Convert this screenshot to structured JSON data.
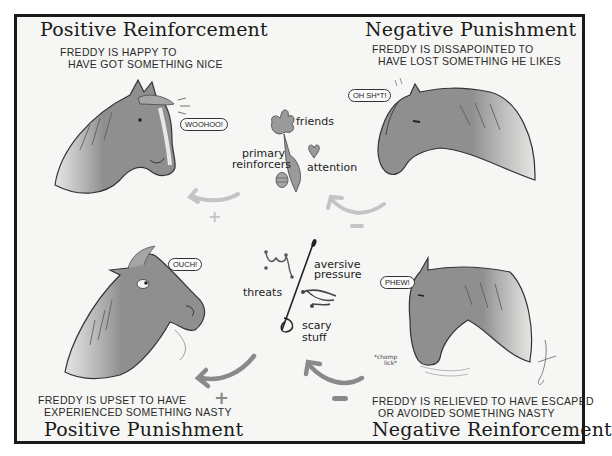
{
  "quadrants": {
    "positive_reinforcement": {
      "title": "Positive Reinforcement",
      "caption_line1": "FREDDY IS HAPPY TO",
      "caption_line2": "HAVE GOT SOMETHING NICE",
      "bubble": "WOOHOO!",
      "sign": "+"
    },
    "negative_punishment": {
      "title": "Negative Punishment",
      "caption_line1": "FREDDY IS DISSAPOINTED TO",
      "caption_line2": "HAVE LOST SOMETHING HE LIKES",
      "bubble": "OH SH*T!",
      "sign": "–"
    },
    "positive_punishment": {
      "title": "Positive Punishment",
      "caption_line1": "FREDDY IS UPSET TO HAVE",
      "caption_line2": "EXPERIENCED SOMETHING NASTY",
      "bubble": "OUCH!",
      "sign": "+"
    },
    "negative_reinforcement": {
      "title": "Negative Reinforcement",
      "caption_line1": "FREDDY IS RELIEVED TO HAVE ESCAPED",
      "caption_line2": "OR AVOIDED SOMETHING NASTY",
      "bubble": "PHEW!",
      "sign": "–",
      "note_line1": "*chomp",
      "note_line2": "lick*"
    }
  },
  "center_top": {
    "labels": {
      "friends": "friends",
      "primary_line1": "primary",
      "primary_line2": "reinforcers",
      "attention": "attention"
    },
    "icons": [
      "hand-icon",
      "carrot-icon",
      "heart-icon",
      "treat-icon"
    ]
  },
  "center_bottom": {
    "labels": {
      "threats": "threats",
      "aversive_line1": "aversive",
      "aversive_line2": "pressure",
      "scary_line1": "scary",
      "scary_line2": "stuff"
    },
    "icons": [
      "bit-icon",
      "whip-icon",
      "spur-icon"
    ]
  },
  "colors": {
    "horse": "#8f8f8f",
    "horse_dark": "#5e5e5e",
    "arrow_top": "#c4c4c4",
    "arrow_bottom": "#8a8a8a",
    "ink": "#1a1a1a",
    "frame_bg": "#f6f6f4"
  }
}
